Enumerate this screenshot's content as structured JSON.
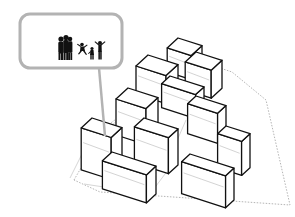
{
  "diagram": {
    "title": "",
    "colors": {
      "building_stroke": "#111111",
      "site_boundary": "#b5b5b5",
      "callout_stroke": "#b3b3b3",
      "figures": "#111111",
      "background": "#ffffff"
    },
    "callout": {
      "icon": "people-family-silhouettes-icon",
      "figures": [
        "adult",
        "adult",
        "adult",
        "child-jumping",
        "child",
        "adult-arms-raised"
      ]
    },
    "site_boundary_points": "74,180 104,128 196,60 232,72 266,100 290,205 100,192",
    "buildings": [
      {
        "name": "block-north-1",
        "x": 178,
        "y": 38,
        "w": 24,
        "d": 18,
        "h": 24
      },
      {
        "name": "block-north-2",
        "x": 196,
        "y": 52,
        "w": 26,
        "d": 18,
        "h": 28
      },
      {
        "name": "block-west-upper",
        "x": 148,
        "y": 55,
        "w": 30,
        "d": 20,
        "h": 28
      },
      {
        "name": "block-center",
        "x": 170,
        "y": 76,
        "w": 34,
        "d": 14,
        "h": 24
      },
      {
        "name": "block-mid-left",
        "x": 128,
        "y": 88,
        "w": 30,
        "d": 20,
        "h": 36
      },
      {
        "name": "block-mid-right",
        "x": 196,
        "y": 96,
        "w": 30,
        "d": 14,
        "h": 30
      },
      {
        "name": "block-right",
        "x": 226,
        "y": 126,
        "w": 24,
        "d": 14,
        "h": 34
      },
      {
        "name": "block-center-low",
        "x": 144,
        "y": 118,
        "w": 34,
        "d": 16,
        "h": 36
      },
      {
        "name": "block-southwest",
        "x": 92,
        "y": 118,
        "w": 30,
        "d": 18,
        "h": 42
      },
      {
        "name": "block-south",
        "x": 112,
        "y": 152,
        "w": 44,
        "d": 16,
        "h": 28
      },
      {
        "name": "block-southeast",
        "x": 190,
        "y": 154,
        "w": 44,
        "d": 14,
        "h": 32
      }
    ]
  }
}
